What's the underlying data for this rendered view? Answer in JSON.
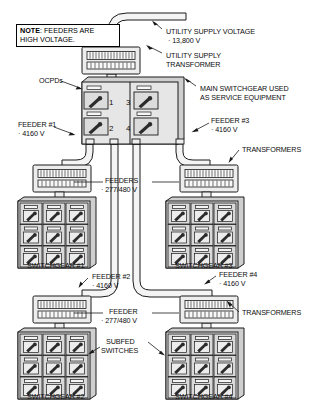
{
  "diagram": {
    "note": {
      "prefix": "NOTE",
      "separator": ": ",
      "line1": "FEEDERS ARE",
      "line2": "HIGH VOLTAGE."
    },
    "labels": {
      "utility_supply_voltage": "UTILITY SUPPLY VOLTAGE",
      "utility_supply_voltage_value": "· 13,800 V",
      "utility_supply_transformer_l1": "UTILITY SUPPLY",
      "utility_supply_transformer_l2": "TRANSFORMER",
      "ocpds": "OCPDs",
      "main_switchgear_l1": "MAIN SWITCHGEAR USED",
      "main_switchgear_l2": "AS SERVICE EQUIPMENT",
      "feeder1": "FEEDER #1",
      "feeder1_value": "· 4160 V",
      "feeder2": "FEEDER #2",
      "feeder2_value": "· 4160 V",
      "feeder3": "FEEDER #3",
      "feeder3_value": "· 4160 V",
      "feeder4": "FEEDER #4",
      "feeder4_value": "· 4160 V",
      "transformers_upper": "TRANSFORMERS",
      "transformers_lower": "TRANSFORMERS",
      "feeders_mid": "FEEDERS",
      "feeders_mid_value": "· 277/480 V",
      "feeder_lower": "FEEDER",
      "feeder_lower_value": "· 277/480 V",
      "subfed_l1": "SUBFED",
      "subfed_l2": "SWITCHES",
      "switchgear1": "SWITCHGEAR #1",
      "switchgear2": "SWITCHGEAR #2",
      "switchgear3": "SWITCHGEAR #3",
      "switchgear4": "SWITCHGEAR #4"
    },
    "ocpd_numbers": [
      "1",
      "2",
      "3",
      "4"
    ],
    "colors": {
      "line": "#1a1a1a",
      "panel_fill": "#e8e8e8",
      "panel_fill_dark": "#d8d8d8",
      "cell_fill": "#dcdcdc",
      "conduit_fill": "#f2f2f2",
      "text": "#0d0d0d",
      "background": "#ffffff"
    },
    "switchgear_cell_count": 9,
    "switchgear_grid": {
      "rows": 3,
      "cols": 3
    },
    "ocpd_count": 4,
    "transformer_count": 4
  }
}
